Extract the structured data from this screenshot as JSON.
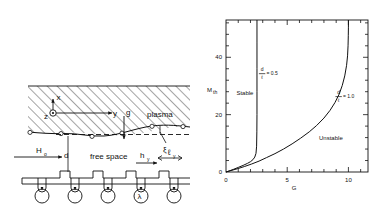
{
  "figure": {
    "panels": [
      "schematic",
      "stability-chart"
    ]
  },
  "schematic": {
    "labels": {
      "plasma": "plasma",
      "free_space": "free space",
      "axis_x": "x",
      "axis_y": "y",
      "axis_z": "z",
      "gravity": "g",
      "field": "H",
      "field_sub": "o",
      "gap": "d",
      "hy": "h",
      "hy_sub": "y",
      "ly": "ℓ",
      "ly_sub": "y",
      "xi": "ξ",
      "lambda": "λ"
    },
    "icons": {
      "z_axis": "circle-dot-icon",
      "hatching": "hatch-pattern-icon",
      "coil": "current-loop-icon"
    }
  },
  "chart_data": {
    "type": "line",
    "title": "",
    "xlabel": "G",
    "ylabel": "M",
    "ylabel_sub": "th",
    "xlim": [
      0,
      11.6
    ],
    "ylim": [
      0,
      53
    ],
    "xticks": [
      0,
      5,
      10
    ],
    "xtick_labels": [
      "0",
      "5",
      "10"
    ],
    "yticks": [
      0,
      20,
      40
    ],
    "ytick_labels": [
      "0",
      "20",
      "40"
    ],
    "x_minor_step": 1,
    "y_minor_step": 4,
    "grid": false,
    "legend": "none",
    "annotations": [
      {
        "name": "stable-region-label",
        "text": "Stable",
        "x": 0.85,
        "y": 27
      },
      {
        "name": "unstable-region-label",
        "text": "Unstable",
        "x": 7.6,
        "y": 11
      },
      {
        "name": "curve-label-0p5",
        "text": "= 0.5",
        "num": "d",
        "den": "ℓ",
        "x": 2.95,
        "y": 34.5
      },
      {
        "name": "curve-label-1p0",
        "text": "= 1.0",
        "num": "d",
        "den": "ℓ",
        "x": 9.2,
        "y": 26.5
      }
    ],
    "series": [
      {
        "name": "d/l = 0.5",
        "label": "d/ℓ = 0.5",
        "x": [
          0.0,
          0.25,
          0.6,
          1.0,
          1.4,
          1.75,
          2.0,
          2.2,
          2.35,
          2.45,
          2.5,
          2.52,
          2.53,
          2.53,
          2.53,
          2.53,
          2.53
        ],
        "y": [
          0.0,
          0.35,
          0.9,
          1.6,
          2.3,
          3.0,
          3.6,
          4.3,
          5.2,
          6.5,
          9.0,
          14.0,
          20.0,
          28.0,
          36.0,
          45.0,
          53.0
        ]
      },
      {
        "name": "d/l = 1.0",
        "label": "d/ℓ = 1.0",
        "x": [
          0.0,
          0.4,
          0.9,
          1.5,
          2.1,
          2.7,
          3.3,
          4.0,
          4.7,
          5.4,
          6.1,
          6.8,
          7.4,
          8.0,
          8.5,
          8.9,
          9.25,
          9.5,
          9.7,
          9.85,
          9.93,
          9.97,
          9.99,
          10.0,
          10.0
        ],
        "y": [
          0.0,
          0.5,
          1.1,
          1.9,
          2.8,
          3.8,
          5.0,
          6.4,
          8.0,
          9.8,
          11.8,
          14.0,
          16.2,
          18.8,
          21.5,
          24.2,
          27.2,
          30.2,
          33.5,
          37.2,
          40.5,
          44.0,
          47.5,
          50.5,
          53.0
        ]
      }
    ]
  },
  "colors": {
    "ink": "#111111",
    "background": "#ffffff"
  }
}
